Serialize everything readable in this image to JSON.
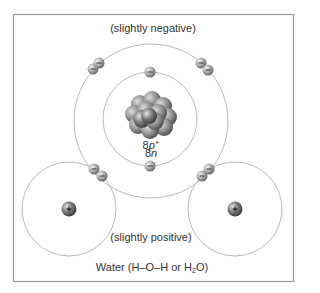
{
  "title": "Water (H–O–H or H2O)",
  "caption": {
    "prefix": "Water (H–O–H or H",
    "subscript": "2",
    "suffix": "O)"
  },
  "labels": {
    "top": "(slightly negative)",
    "bottom": "(slightly positive)"
  },
  "nucleus": {
    "protons_count": "8",
    "protons_symbol": "p",
    "protons_charge": "+",
    "neutrons_count": "8",
    "neutrons_symbol": "n"
  },
  "atoms": {
    "oxygen": {
      "inner_shell_electrons": 2,
      "outer_shell_electrons": 8
    },
    "hydrogen_left": {
      "proton_symbol": "+"
    },
    "hydrogen_right": {
      "proton_symbol": "+"
    }
  },
  "electron_symbol": "–",
  "colors": {
    "frame": "#999999",
    "orbit": "#bbbbbb",
    "particle": "#888888",
    "text": "#333333"
  }
}
